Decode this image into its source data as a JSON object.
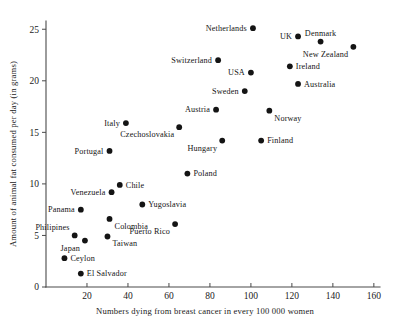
{
  "chart_data": {
    "type": "scatter",
    "title": "",
    "xlabel": "Numbers dying from breast cancer in every 100 000 women",
    "ylabel": "Amount of animal fat consumed per day (in grams)",
    "xlim": [
      0,
      163
    ],
    "ylim": [
      0,
      25.8
    ],
    "xticks": [
      20,
      40,
      60,
      80,
      100,
      120,
      140,
      160
    ],
    "yticks": [
      0,
      5,
      10,
      15,
      20,
      25
    ],
    "xtick_labels": [
      "20",
      "40",
      "60",
      "80",
      "100",
      "120",
      "140",
      "160"
    ],
    "ytick_labels": [
      "0",
      "5",
      "10",
      "15",
      "20",
      "25"
    ],
    "grid": false,
    "legend": "none",
    "marker": "filled-circle",
    "marker_color": "#141414",
    "points": [
      {
        "label": "Netherlands",
        "x": 101,
        "y": 25.1,
        "label_pos": "left"
      },
      {
        "label": "UK",
        "x": 123,
        "y": 24.3,
        "label_pos": "left"
      },
      {
        "label": "Denmark",
        "x": 134,
        "y": 23.8,
        "label_pos": "above"
      },
      {
        "label": "New Zealand",
        "x": 150,
        "y": 23.3,
        "label_pos": "below-left"
      },
      {
        "label": "Switzerland",
        "x": 84,
        "y": 22.0,
        "label_pos": "left"
      },
      {
        "label": "Ireland",
        "x": 119,
        "y": 21.4,
        "label_pos": "right"
      },
      {
        "label": "USA",
        "x": 100,
        "y": 20.8,
        "label_pos": "left"
      },
      {
        "label": "Australia",
        "x": 123,
        "y": 19.7,
        "label_pos": "right"
      },
      {
        "label": "Sweden",
        "x": 97,
        "y": 19.0,
        "label_pos": "left"
      },
      {
        "label": "Austria",
        "x": 83,
        "y": 17.2,
        "label_pos": "left"
      },
      {
        "label": "Norway",
        "x": 109,
        "y": 17.1,
        "label_pos": "below-right"
      },
      {
        "label": "Italy",
        "x": 39,
        "y": 15.9,
        "label_pos": "left"
      },
      {
        "label": "Czechoslovakia",
        "x": 65,
        "y": 15.5,
        "label_pos": "below-left"
      },
      {
        "label": "Hungary",
        "x": 86,
        "y": 14.2,
        "label_pos": "below-left"
      },
      {
        "label": "Finland",
        "x": 105,
        "y": 14.2,
        "label_pos": "right"
      },
      {
        "label": "Portugal",
        "x": 31,
        "y": 13.2,
        "label_pos": "left"
      },
      {
        "label": "Poland",
        "x": 69,
        "y": 11.0,
        "label_pos": "right"
      },
      {
        "label": "Chile",
        "x": 36,
        "y": 9.9,
        "label_pos": "right"
      },
      {
        "label": "Venezuela",
        "x": 32,
        "y": 9.2,
        "label_pos": "left"
      },
      {
        "label": "Yugoslavia",
        "x": 47,
        "y": 8.0,
        "label_pos": "right"
      },
      {
        "label": "Panama",
        "x": 17,
        "y": 7.5,
        "label_pos": "left"
      },
      {
        "label": "Colombia",
        "x": 31,
        "y": 6.6,
        "label_pos": "below-right"
      },
      {
        "label": "Puerto Rico",
        "x": 63,
        "y": 6.1,
        "label_pos": "below-left"
      },
      {
        "label": "Philipines",
        "x": 14,
        "y": 5.0,
        "label_pos": "above-left"
      },
      {
        "label": "Taiwan",
        "x": 30,
        "y": 4.9,
        "label_pos": "below-right"
      },
      {
        "label": "Japan",
        "x": 19,
        "y": 4.5,
        "label_pos": "below-left"
      },
      {
        "label": "Ceylon",
        "x": 9,
        "y": 2.8,
        "label_pos": "right"
      },
      {
        "label": "El Salvador",
        "x": 17,
        "y": 1.3,
        "label_pos": "right"
      }
    ]
  },
  "figure": {
    "background": "#ffffff",
    "axis_color": "#4a4a4a",
    "marker_color": "#141414",
    "text_color": "#1a1a1a"
  }
}
